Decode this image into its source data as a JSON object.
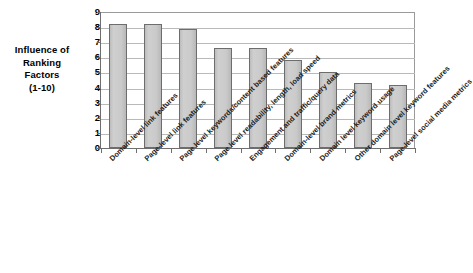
{
  "chart_data": {
    "type": "bar",
    "title": "",
    "subtitle": "",
    "xlabel": "",
    "ylabel": "Influence of Ranking Factors (1-10)",
    "ylim": [
      0,
      9
    ],
    "ytick_step": 1,
    "grid": true,
    "grid_axis": "y",
    "legend": false,
    "legend_position": "none",
    "orientation": "vertical",
    "xtick_label_rotation": -45,
    "categories": [
      "Domain-level link features",
      "Page-level link features",
      "Page level keywords/content based features",
      "Page level readability, length, load speed",
      "Engagement and traffic/query data",
      "Domain-level brand metrics",
      "Domain level keyword usage",
      "Other domain level keyword features",
      "Page-level social media metrics"
    ],
    "values": [
      8.2,
      8.2,
      7.9,
      6.6,
      6.6,
      5.8,
      5.0,
      4.3,
      4.2
    ],
    "series": [
      {
        "name": "Influence of Ranking Factors (1-10)",
        "values": [
          8.2,
          8.2,
          7.9,
          6.6,
          6.6,
          5.8,
          5.0,
          4.3,
          4.2
        ],
        "color": "#c9c9c9",
        "edge_color": "#6d6d6d"
      }
    ],
    "ytick_labels": [
      "0",
      "1",
      "2",
      "3",
      "4",
      "5",
      "6",
      "7",
      "8",
      "9"
    ],
    "annotations": []
  },
  "axis_title": {
    "line1": "Influence of",
    "line2": "Ranking",
    "line3": "Factors",
    "line4": "(1-10)"
  },
  "colors": {
    "bar_fill": "#c9c9c9",
    "bar_edge": "#6d6d6d",
    "gridline": "#b9b9b9",
    "axis": "#6e6e6e",
    "text": "#000000",
    "background": "#ffffff"
  }
}
